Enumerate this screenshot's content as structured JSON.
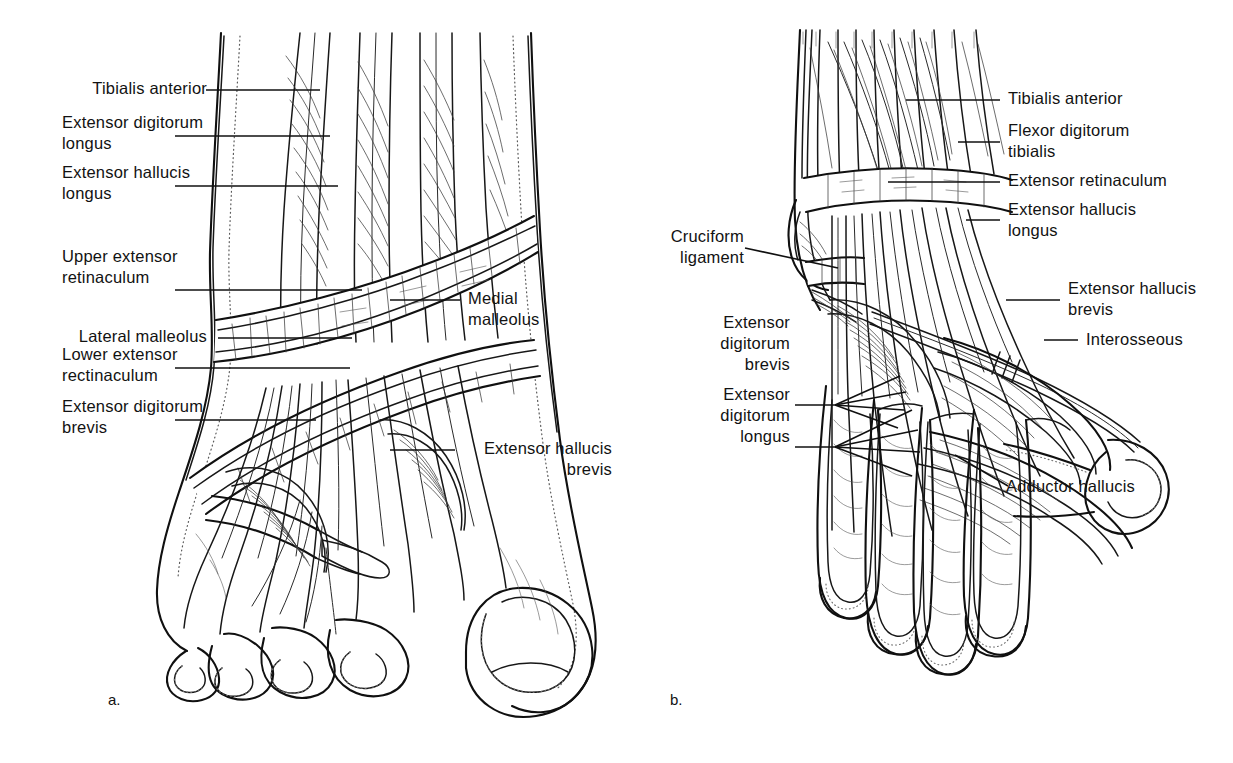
{
  "figure": {
    "background_color": "#ffffff",
    "ink_color": "#101010",
    "panels": [
      {
        "id": "a",
        "caption": "a.",
        "description": "Superficial dissection of the dorsum of a human foot showing extensor tendons and the upper and lower extensor retinacula",
        "labels": [
          {
            "name": "tibialis-anterior",
            "text": "Tibialis anterior",
            "align": "right"
          },
          {
            "name": "extensor-digitorum-longus",
            "text": "Extensor digitorum\nlongus",
            "align": "left"
          },
          {
            "name": "extensor-hallucis-longus",
            "text": "Extensor hallucis\nlongus",
            "align": "left"
          },
          {
            "name": "upper-extensor-retinaculum",
            "text": "Upper extensor\nretinaculum",
            "align": "left"
          },
          {
            "name": "lateral-malleolus",
            "text": "Lateral malleolus",
            "align": "right"
          },
          {
            "name": "lower-extensor-rectinaculum",
            "text": "Lower extensor\nrectinaculum",
            "align": "left"
          },
          {
            "name": "extensor-digitorum-brevis",
            "text": "Extensor digitorum\nbrevis",
            "align": "left"
          },
          {
            "name": "medial-malleolus",
            "text": "Medial\nmalleolus",
            "align": "left"
          },
          {
            "name": "extensor-hallucis-brevis",
            "text": "Extensor hallucis\nbrevis",
            "align": "right"
          }
        ]
      },
      {
        "id": "b",
        "caption": "b.",
        "description": "Deeper dissection of a primate foot showing cruciform ligament, extensor retinaculum, interosseous and adductor hallucis muscles",
        "labels": [
          {
            "name": "tibialis-anterior",
            "text": "Tibialis anterior",
            "align": "left"
          },
          {
            "name": "flexor-digitorum-tibialis",
            "text": "Flexor digitorum\ntibialis",
            "align": "left"
          },
          {
            "name": "extensor-retinaculum",
            "text": "Extensor retinaculum",
            "align": "left"
          },
          {
            "name": "extensor-hallucis-longus",
            "text": "Extensor hallucis\nlongus",
            "align": "left"
          },
          {
            "name": "cruciform-ligament",
            "text": "Cruciform\nligament",
            "align": "right"
          },
          {
            "name": "extensor-hallucis-brevis",
            "text": "Extensor hallucis\nbrevis",
            "align": "left"
          },
          {
            "name": "interosseous",
            "text": "Interosseous",
            "align": "left"
          },
          {
            "name": "extensor-digitorum-brevis",
            "text": "Extensor\ndigitorum\nbrevis",
            "align": "right"
          },
          {
            "name": "extensor-digitorum-longus",
            "text": "Extensor\ndigitorum\nlongus",
            "align": "right"
          },
          {
            "name": "adductor-hallucis",
            "text": "Adductor hallucis",
            "align": "left"
          }
        ]
      }
    ]
  }
}
